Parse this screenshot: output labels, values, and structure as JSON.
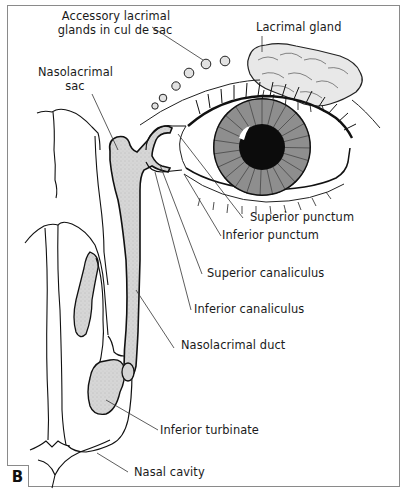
{
  "figure": {
    "panel_label": "B",
    "labels": {
      "accessory_glands_line1": "Accessory lacrimal",
      "accessory_glands_line2": "glands in cul de sac",
      "lacrimal_gland": "Lacrimal gland",
      "nasolacrimal_sac_line1": "Nasolacrimal",
      "nasolacrimal_sac_line2": "sac",
      "superior_punctum": "Superior punctum",
      "inferior_punctum": "Inferior punctum",
      "superior_canaliculus": "Superior canaliculus",
      "inferior_canaliculus": "Inferior canaliculus",
      "nasolacrimal_duct": "Nasolacrimal duct",
      "inferior_turbinate": "Inferior turbinate",
      "nasal_cavity": "Nasal cavity"
    },
    "colors": {
      "ink": "#111111",
      "fill_gray": "#d4d4d4",
      "iris_gray": "#8f8f8f",
      "frame": "#8a8a8a",
      "leader": "#333333"
    }
  }
}
